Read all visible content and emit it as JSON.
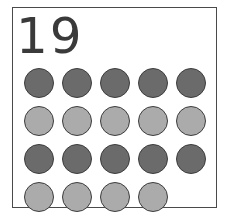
{
  "card": {
    "number_label": "19",
    "total_dots": 19,
    "rows": [
      {
        "shade": "dark",
        "count": 5
      },
      {
        "shade": "light",
        "count": 5
      },
      {
        "shade": "dark",
        "count": 5
      },
      {
        "shade": "light",
        "count": 4
      }
    ],
    "colors": {
      "dark": "#6b6b6b",
      "light": "#ababab",
      "outline": "#3d3d3d",
      "text": "#3a3a3a"
    }
  }
}
